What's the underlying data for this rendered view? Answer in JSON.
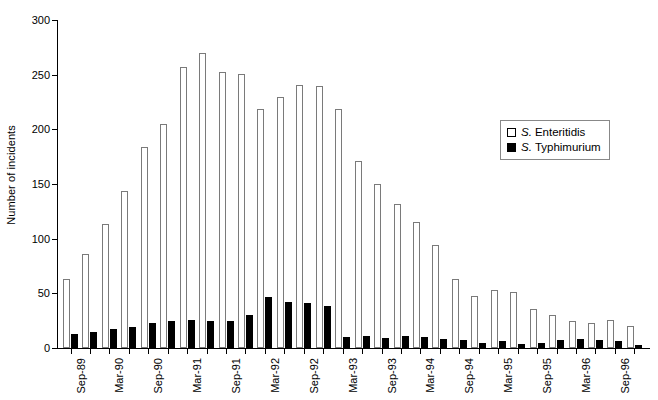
{
  "chart_data": {
    "type": "bar",
    "title": "",
    "xlabel": "",
    "ylabel": "Number of incidents",
    "ylim": [
      0,
      300
    ],
    "ytick_values": [
      0,
      50,
      100,
      150,
      200,
      250,
      300
    ],
    "ytick_labels": [
      "0",
      "50",
      "100",
      "150",
      "200",
      "250",
      "300"
    ],
    "grid": false,
    "legend_position": "top-right",
    "categories": [
      "Sep-89",
      "",
      "Mar-90",
      "",
      "Sep-90",
      "",
      "Mar-91",
      "",
      "Sep-91",
      "",
      "Mar-92",
      "",
      "Sep-92",
      "",
      "Mar-93",
      "",
      "Sep-93",
      "",
      "Mar-94",
      "",
      "Sep-94",
      "",
      "Mar-95",
      "",
      "Sep-95",
      "",
      "Mar-96",
      "",
      "Sep-96",
      ""
    ],
    "xtick_labels": [
      "Sep-89",
      "Mar-90",
      "Sep-90",
      "Mar-91",
      "Sep-91",
      "Mar-92",
      "Sep-92",
      "Mar-93",
      "Sep-93",
      "Mar-94",
      "Sep-94",
      "Mar-95",
      "Sep-95",
      "Mar-96",
      "Sep-96"
    ],
    "series": [
      {
        "name": "S. Enteritidis",
        "genus": "S.",
        "species": "Enteritidis",
        "style": "open",
        "color": "#ffffff",
        "edge_color": "#7a7a7a",
        "values": [
          63,
          86,
          113,
          144,
          184,
          205,
          257,
          270,
          252,
          251,
          219,
          230,
          241,
          240,
          219,
          171,
          150,
          132,
          115,
          94,
          63,
          48,
          53,
          51,
          36,
          30,
          25,
          23,
          26,
          20
        ]
      },
      {
        "name": "S. Typhimurium",
        "genus": "S.",
        "species": "Typhimurium",
        "style": "solid",
        "color": "#000000",
        "edge_color": "#000000",
        "values": [
          13,
          15,
          17,
          19,
          23,
          25,
          26,
          25,
          25,
          30,
          47,
          42,
          41,
          38,
          10,
          11,
          9,
          11,
          10,
          8,
          7,
          5,
          6,
          4,
          5,
          7,
          8,
          7,
          6,
          3
        ]
      }
    ]
  },
  "legend": {
    "entries": [
      {
        "genus": "S.",
        "species": "Enteritidis",
        "swatch": "open-square-swatch"
      },
      {
        "genus": "S.",
        "species": "Typhimurium",
        "swatch": "solid-square-swatch"
      }
    ]
  }
}
